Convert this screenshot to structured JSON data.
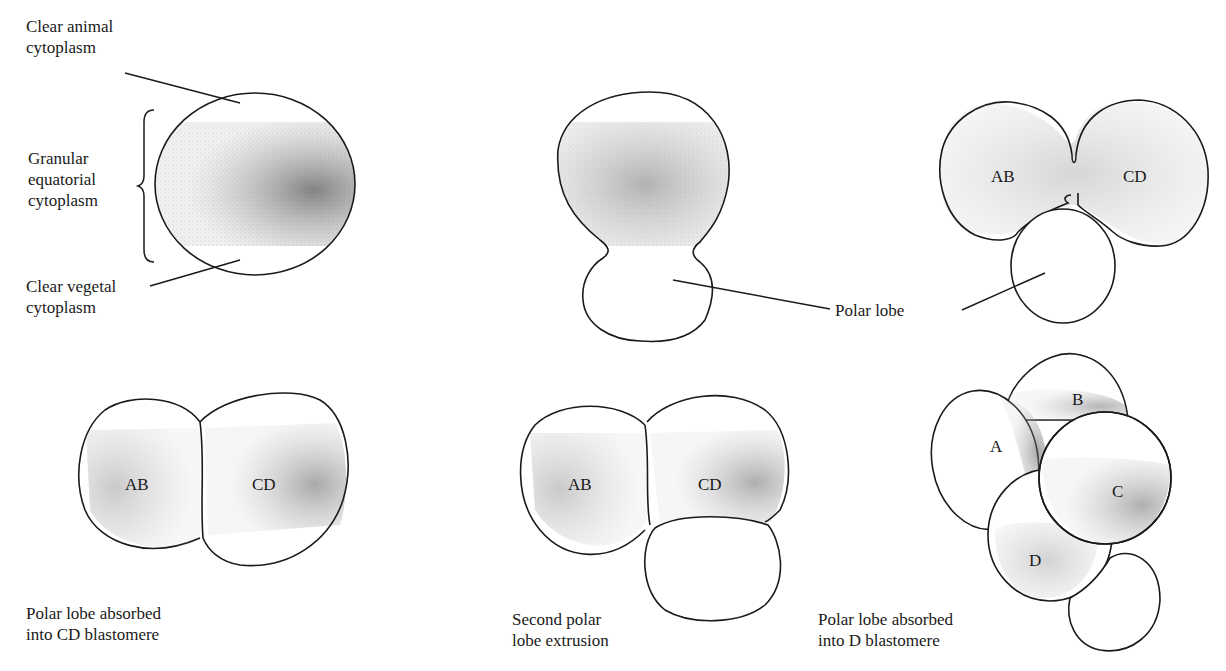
{
  "figure": {
    "top_labels": {
      "clear_animal": "Clear animal\ncytoplasm",
      "granular_equatorial": "Granular\nequatorial\ncytoplasm",
      "clear_vegetal": "Clear vegetal\ncytoplasm",
      "polar_lobe": "Polar lobe"
    },
    "cells": {
      "two_cell_top": {
        "left": "AB",
        "right": "CD"
      },
      "two_cell_absorbed": {
        "left": "AB",
        "right": "CD"
      },
      "second_extrusion": {
        "left": "AB",
        "right": "CD"
      },
      "four_cell": {
        "a": "A",
        "b": "B",
        "c": "C",
        "d": "D"
      }
    },
    "captions": {
      "absorbed_cd": "Polar lobe absorbed\ninto CD blastomere",
      "second_extrusion": "Second polar\nlobe extrusion",
      "absorbed_d": "Polar lobe absorbed\ninto D blastomere"
    }
  }
}
